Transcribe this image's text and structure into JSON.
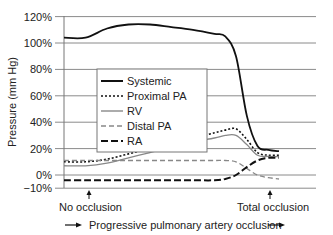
{
  "chart_data": {
    "type": "line",
    "title": "",
    "xlabel": "Progressive pulmonary artery occlusion",
    "ylabel": "Pressure (mm Hg)",
    "ylim": [
      -10,
      120
    ],
    "yticks": [
      "120%",
      "100%",
      "80%",
      "60%",
      "40%",
      "20%",
      "0%",
      "−10%"
    ],
    "grid": true,
    "legend_position": "center-left inside plot",
    "annotations": [
      {
        "text": "No occlusion",
        "position": "left, arrow pointing to x-axis start"
      },
      {
        "text": "Total occlusion",
        "position": "right, arrow pointing to x-axis end"
      }
    ],
    "x": [
      0,
      10,
      20,
      30,
      40,
      50,
      60,
      70,
      75,
      80,
      85,
      90,
      95,
      100
    ],
    "series": [
      {
        "name": "Systemic",
        "style": "solid-thick",
        "color": "#111111",
        "values": [
          104,
          104,
          111,
          114,
          114,
          112,
          110,
          107,
          105,
          90,
          45,
          22,
          19,
          18
        ]
      },
      {
        "name": "Proximal PA",
        "style": "dotted",
        "color": "#111111",
        "values": [
          10,
          10,
          12,
          16,
          20,
          24,
          28,
          32,
          34,
          35,
          27,
          17,
          15,
          15
        ]
      },
      {
        "name": "RV",
        "style": "solid-thin",
        "color": "#888888",
        "values": [
          7,
          7,
          9,
          13,
          17,
          21,
          25,
          28,
          30,
          30,
          23,
          15,
          14,
          14
        ]
      },
      {
        "name": "Distal PA",
        "style": "dashed",
        "color": "#888888",
        "values": [
          11,
          11,
          11,
          11,
          11,
          11,
          11,
          11,
          11,
          10,
          5,
          0,
          -2,
          -3
        ]
      },
      {
        "name": "RA",
        "style": "long-dash",
        "color": "#111111",
        "values": [
          -4,
          -4,
          -4,
          -4,
          -4,
          -4,
          -4,
          -4,
          -3,
          0,
          6,
          11,
          13,
          13
        ]
      }
    ]
  },
  "axis": {
    "ylabel": "Pressure (mm Hg)",
    "xlabel": "Progressive pulmonary artery occlusion",
    "yticks": [
      {
        "label": "120%",
        "value": 120
      },
      {
        "label": "100%",
        "value": 100
      },
      {
        "label": "80%",
        "value": 80
      },
      {
        "label": "60%",
        "value": 60
      },
      {
        "label": "40%",
        "value": 40
      },
      {
        "label": "20%",
        "value": 20
      },
      {
        "label": "0%",
        "value": 0
      },
      {
        "label": "−10%",
        "value": -10
      }
    ]
  },
  "legend": {
    "items": [
      {
        "label": "Systemic"
      },
      {
        "label": "Proximal PA"
      },
      {
        "label": "RV"
      },
      {
        "label": "Distal PA"
      },
      {
        "label": "RA"
      }
    ]
  },
  "annotations": {
    "start": "No occlusion",
    "end": "Total occlusion"
  }
}
